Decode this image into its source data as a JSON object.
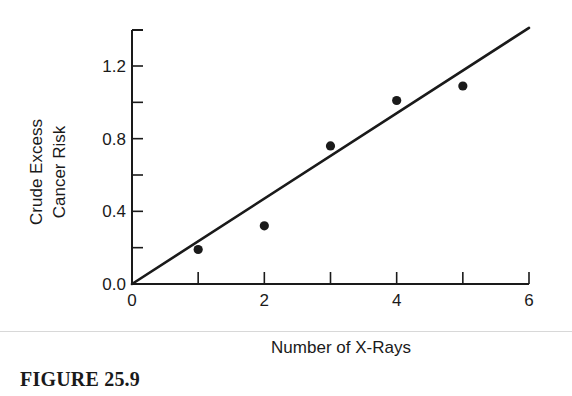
{
  "figure": {
    "caption": "FIGURE 25.9",
    "ink_color": "#1a1a1a",
    "background": "#ffffff"
  },
  "chart_data": {
    "type": "scatter",
    "title": "",
    "xlabel": "Number of X-Rays",
    "ylabel_lines": [
      "Crude Excess",
      "Cancer Risk"
    ],
    "ylabel": "Crude Excess Cancer Risk",
    "xlim": [
      0,
      6
    ],
    "ylim": [
      0,
      1.4
    ],
    "x_ticks": [
      0,
      1,
      2,
      3,
      4,
      5,
      6
    ],
    "x_tick_labels": [
      "0",
      "",
      "2",
      "",
      "4",
      "",
      "6"
    ],
    "y_ticks": [
      0.0,
      0.2,
      0.4,
      0.6,
      0.8,
      1.0,
      1.2
    ],
    "y_tick_labels": [
      "0.0",
      "",
      "0.4",
      "",
      "0.8",
      "",
      "1.2"
    ],
    "grid": false,
    "legend": null,
    "series": [
      {
        "name": "Observed",
        "kind": "points",
        "x": [
          1,
          2,
          3,
          4,
          5
        ],
        "y": [
          0.19,
          0.32,
          0.76,
          1.01,
          1.09
        ]
      },
      {
        "name": "Linear fit through origin",
        "kind": "line",
        "x": [
          0,
          6
        ],
        "y": [
          0.0,
          1.41
        ],
        "slope": 0.235
      }
    ]
  }
}
